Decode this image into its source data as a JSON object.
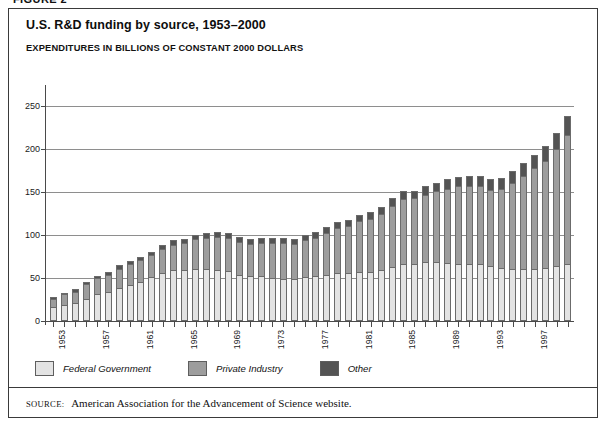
{
  "figure_caption": "FIGURE 2",
  "chart_data": {
    "type": "bar",
    "stacked": true,
    "title": "U.S. R&D funding by source, 1953–2000",
    "subtitle": "EXPENDITURES IN BILLIONS OF CONSTANT 2000 DOLLARS",
    "xlabel": "",
    "ylabel": "",
    "ylim": [
      0,
      275
    ],
    "yticks": [
      0,
      50,
      100,
      150,
      200,
      250
    ],
    "ytick_labels": [
      "0",
      "50",
      "100",
      "150",
      "200",
      "250"
    ],
    "grid": true,
    "legend_position": "below-axis-left",
    "x": [
      1953,
      1954,
      1955,
      1956,
      1957,
      1958,
      1959,
      1960,
      1961,
      1962,
      1963,
      1964,
      1965,
      1966,
      1967,
      1968,
      1969,
      1970,
      1971,
      1972,
      1973,
      1974,
      1975,
      1976,
      1977,
      1978,
      1979,
      1980,
      1981,
      1982,
      1983,
      1984,
      1985,
      1986,
      1987,
      1988,
      1989,
      1990,
      1991,
      1992,
      1993,
      1994,
      1995,
      1996,
      1997,
      1998,
      1999,
      2000
    ],
    "xtick_labels": [
      "1953",
      "1957",
      "1961",
      "1965",
      "1969",
      "1973",
      "1977",
      "1981",
      "1985",
      "1989",
      "1993",
      "1997"
    ],
    "series": [
      {
        "name": "Federal Government",
        "color": "#e3e3e3",
        "values": [
          16,
          19,
          21,
          26,
          31,
          34,
          39,
          42,
          46,
          51,
          56,
          59,
          59,
          61,
          61,
          60,
          58,
          54,
          52,
          52,
          50,
          49,
          49,
          51,
          52,
          54,
          56,
          56,
          57,
          57,
          60,
          63,
          67,
          67,
          69,
          69,
          68,
          67,
          66,
          66,
          64,
          62,
          61,
          61,
          61,
          62,
          64,
          67
        ]
      },
      {
        "name": "Private Industry",
        "color": "#9d9d9d",
        "values": [
          10,
          12,
          13,
          17,
          19,
          20,
          22,
          24,
          25,
          26,
          28,
          30,
          32,
          34,
          36,
          38,
          39,
          38,
          38,
          39,
          41,
          42,
          41,
          43,
          45,
          48,
          52,
          55,
          59,
          62,
          65,
          71,
          75,
          76,
          78,
          82,
          86,
          90,
          91,
          91,
          89,
          92,
          100,
          108,
          117,
          125,
          136,
          150
        ]
      },
      {
        "name": "Other",
        "color": "#545454",
        "values": [
          2,
          2,
          3,
          3,
          3,
          3,
          4,
          4,
          4,
          4,
          5,
          5,
          5,
          5,
          6,
          6,
          6,
          6,
          6,
          6,
          6,
          6,
          6,
          6,
          7,
          7,
          7,
          7,
          8,
          8,
          8,
          9,
          9,
          9,
          10,
          10,
          11,
          11,
          12,
          12,
          12,
          13,
          14,
          15,
          16,
          17,
          19,
          22
        ]
      }
    ]
  },
  "legend": {
    "items": [
      {
        "label": "Federal Government",
        "color": "#e3e3e3"
      },
      {
        "label": "Private Industry",
        "color": "#9d9d9d"
      },
      {
        "label": "Other",
        "color": "#545454"
      }
    ]
  },
  "source": {
    "label": "SOURCE:",
    "text": "American Association for the Advancement of Science website."
  }
}
